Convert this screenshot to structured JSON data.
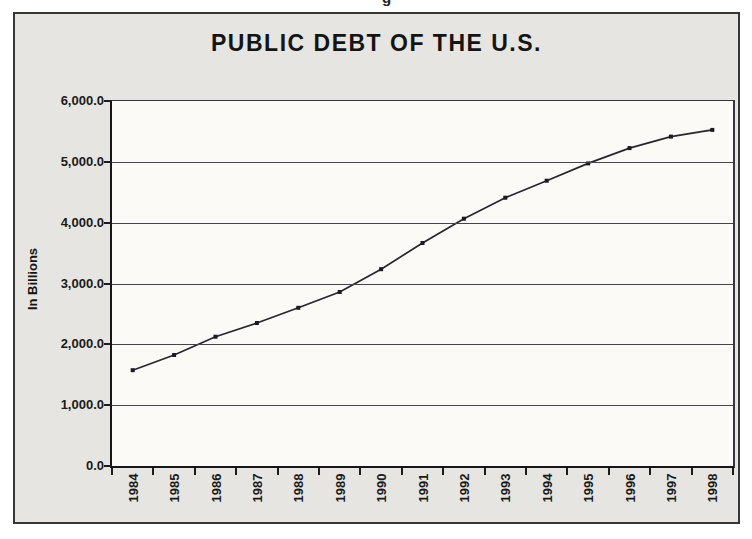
{
  "top_artifact": {
    "text": "g"
  },
  "chart_data": {
    "type": "line",
    "title": "PUBLIC DEBT OF THE U.S.",
    "xlabel": "",
    "ylabel": "In Billions",
    "categories": [
      "1984",
      "1985",
      "1986",
      "1987",
      "1988",
      "1989",
      "1990",
      "1991",
      "1992",
      "1993",
      "1994",
      "1995",
      "1996",
      "1997",
      "1998"
    ],
    "series": [
      {
        "name": "Public debt",
        "values": [
          1575,
          1825,
          2125,
          2350,
          2600,
          2860,
          3235,
          3665,
          4065,
          4410,
          4690,
          4975,
          5225,
          5415,
          5525
        ]
      }
    ],
    "ylim": [
      0,
      6000
    ],
    "ytick_interval": 1000,
    "ytick_labels": [
      "0.0",
      "1,000.0",
      "2,000.0",
      "3,000.0",
      "4,000.0",
      "5,000.0",
      "6,000.0"
    ],
    "grid": true,
    "legend": false,
    "marker": "square",
    "line_color": "#26262b",
    "marker_color": "#1b1b20",
    "frame_bg": "#e6e5e1",
    "plot_bg": "#fbfaf7"
  }
}
